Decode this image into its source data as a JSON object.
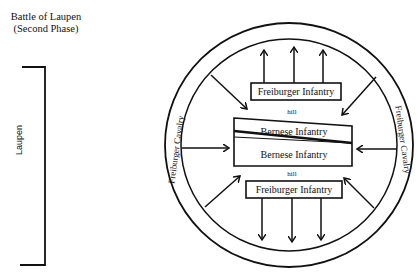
{
  "title": {
    "line1": "Battle of Laupen",
    "line2": "(Second Phase)"
  },
  "town": {
    "label": "Laupen"
  },
  "diagram": {
    "outer_ring_labels": {
      "top": "Freiburger Cavalry",
      "bottom": "Freiburger Cavalry",
      "left": "Freiburger Cavalry",
      "right": "Freiburger Cavalry"
    },
    "boxes": {
      "top_infantry": "Freiburger Infantry",
      "bernese_upper": "Bernese Infantry",
      "bernese_lower": "Bernese Infantry",
      "bottom_infantry": "Freiburger Infantry"
    },
    "terrain": {
      "hill_top": "hill",
      "hill_bottom": "hill"
    }
  }
}
